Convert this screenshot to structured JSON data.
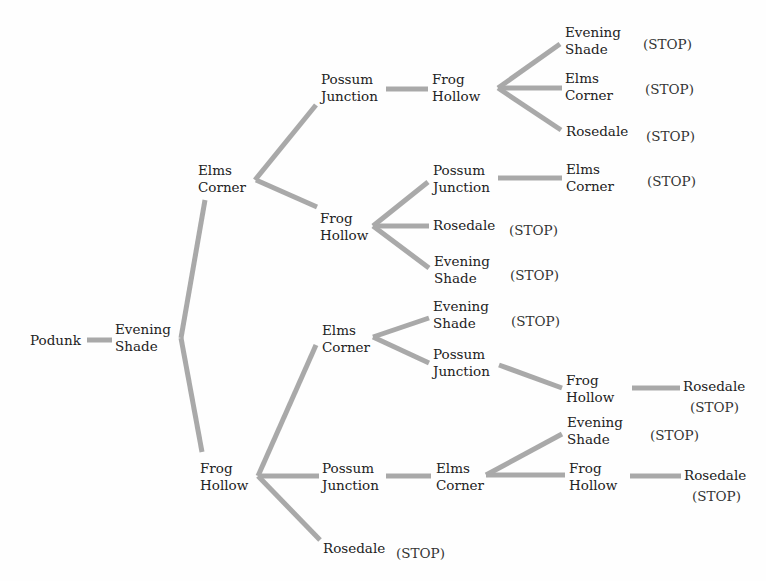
{
  "diagram": {
    "type": "tree",
    "root": "Podunk",
    "colors": {
      "edge": "#a9a9a9",
      "text": "#222222"
    },
    "nodes": [
      {
        "id": "n0",
        "lines": [
          "Podunk"
        ],
        "x": 30,
        "y": 332
      },
      {
        "id": "n1",
        "lines": [
          "Evening",
          "Shade"
        ],
        "x": 115,
        "y": 321
      },
      {
        "id": "n2",
        "lines": [
          "Elms",
          "Corner"
        ],
        "x": 198,
        "y": 162
      },
      {
        "id": "n3",
        "lines": [
          "Possum",
          "Junction"
        ],
        "x": 321,
        "y": 71
      },
      {
        "id": "n4",
        "lines": [
          "Frog",
          "Hollow"
        ],
        "x": 432,
        "y": 71
      },
      {
        "id": "n5",
        "lines": [
          "Evening",
          "Shade"
        ],
        "x": 565,
        "y": 24
      },
      {
        "id": "n6",
        "lines": [
          "Elms",
          "Corner"
        ],
        "x": 565,
        "y": 70
      },
      {
        "id": "n7",
        "lines": [
          "Rosedale"
        ],
        "x": 566,
        "y": 123
      },
      {
        "id": "n8",
        "lines": [
          "Frog",
          "Hollow"
        ],
        "x": 320,
        "y": 210
      },
      {
        "id": "n9",
        "lines": [
          "Possum",
          "Junction"
        ],
        "x": 433,
        "y": 162
      },
      {
        "id": "n10",
        "lines": [
          "Elms",
          "Corner"
        ],
        "x": 566,
        "y": 161
      },
      {
        "id": "n11",
        "lines": [
          "Rosedale"
        ],
        "x": 433,
        "y": 217
      },
      {
        "id": "n12",
        "lines": [
          "Evening",
          "Shade"
        ],
        "x": 434,
        "y": 253
      },
      {
        "id": "n13",
        "lines": [
          "Frog",
          "Hollow"
        ],
        "x": 200,
        "y": 460
      },
      {
        "id": "n14",
        "lines": [
          "Elms",
          "Corner"
        ],
        "x": 322,
        "y": 322
      },
      {
        "id": "n15",
        "lines": [
          "Evening",
          "Shade"
        ],
        "x": 433,
        "y": 298
      },
      {
        "id": "n16",
        "lines": [
          "Possum",
          "Junction"
        ],
        "x": 433,
        "y": 346
      },
      {
        "id": "n17",
        "lines": [
          "Frog",
          "Hollow"
        ],
        "x": 566,
        "y": 372
      },
      {
        "id": "n18",
        "lines": [
          "Rosedale"
        ],
        "x": 683,
        "y": 378
      },
      {
        "id": "n19",
        "lines": [
          "Possum",
          "Junction"
        ],
        "x": 322,
        "y": 460
      },
      {
        "id": "n20",
        "lines": [
          "Elms",
          "Corner"
        ],
        "x": 436,
        "y": 460
      },
      {
        "id": "n21",
        "lines": [
          "Evening",
          "Shade"
        ],
        "x": 567,
        "y": 414
      },
      {
        "id": "n22",
        "lines": [
          "Frog",
          "Hollow"
        ],
        "x": 569,
        "y": 460
      },
      {
        "id": "n23",
        "lines": [
          "Rosedale"
        ],
        "x": 684,
        "y": 467
      },
      {
        "id": "n24",
        "lines": [
          "Rosedale"
        ],
        "x": 323,
        "y": 540
      }
    ],
    "stop_label": "(STOP)",
    "stops": [
      {
        "after": "n5",
        "x": 643,
        "y": 36
      },
      {
        "after": "n6",
        "x": 645,
        "y": 81
      },
      {
        "after": "n7",
        "x": 646,
        "y": 128
      },
      {
        "after": "n10",
        "x": 647,
        "y": 173
      },
      {
        "after": "n11",
        "x": 509,
        "y": 222
      },
      {
        "after": "n12",
        "x": 510,
        "y": 267
      },
      {
        "after": "n15",
        "x": 511,
        "y": 313
      },
      {
        "after": "n18",
        "x": 690,
        "y": 399
      },
      {
        "after": "n21",
        "x": 650,
        "y": 427
      },
      {
        "after": "n23",
        "x": 692,
        "y": 488
      },
      {
        "after": "n24",
        "x": 396,
        "y": 545
      }
    ],
    "edges": [
      {
        "from": "n0",
        "to": "n1",
        "x1": 87,
        "y1": 340,
        "x2": 112,
        "y2": 340
      },
      {
        "from": "n1",
        "to": "n2",
        "x1": 181,
        "y1": 338,
        "x2": 205,
        "y2": 200
      },
      {
        "from": "n1",
        "to": "n13",
        "x1": 181,
        "y1": 338,
        "x2": 202,
        "y2": 452
      },
      {
        "from": "n2",
        "to": "n3",
        "x1": 255,
        "y1": 180,
        "x2": 316,
        "y2": 105
      },
      {
        "from": "n2",
        "to": "n8",
        "x1": 256,
        "y1": 180,
        "x2": 317,
        "y2": 207
      },
      {
        "from": "n3",
        "to": "n4",
        "x1": 386,
        "y1": 89,
        "x2": 428,
        "y2": 89
      },
      {
        "from": "n4",
        "to": "n5",
        "x1": 498,
        "y1": 88,
        "x2": 560,
        "y2": 44
      },
      {
        "from": "n4",
        "to": "n6",
        "x1": 498,
        "y1": 88,
        "x2": 562,
        "y2": 88
      },
      {
        "from": "n4",
        "to": "n7",
        "x1": 498,
        "y1": 88,
        "x2": 561,
        "y2": 130
      },
      {
        "from": "n8",
        "to": "n9",
        "x1": 373,
        "y1": 226,
        "x2": 428,
        "y2": 182
      },
      {
        "from": "n8",
        "to": "n11",
        "x1": 373,
        "y1": 226,
        "x2": 429,
        "y2": 226
      },
      {
        "from": "n8",
        "to": "n12",
        "x1": 373,
        "y1": 226,
        "x2": 429,
        "y2": 268
      },
      {
        "from": "n9",
        "to": "n10",
        "x1": 498,
        "y1": 178,
        "x2": 562,
        "y2": 178
      },
      {
        "from": "n13",
        "to": "n14",
        "x1": 258,
        "y1": 476,
        "x2": 316,
        "y2": 345
      },
      {
        "from": "n13",
        "to": "n19",
        "x1": 258,
        "y1": 476,
        "x2": 319,
        "y2": 476
      },
      {
        "from": "n13",
        "to": "n24",
        "x1": 258,
        "y1": 476,
        "x2": 320,
        "y2": 540
      },
      {
        "from": "n14",
        "to": "n15",
        "x1": 373,
        "y1": 337,
        "x2": 429,
        "y2": 318
      },
      {
        "from": "n14",
        "to": "n16",
        "x1": 373,
        "y1": 337,
        "x2": 429,
        "y2": 363
      },
      {
        "from": "n16",
        "to": "n17",
        "x1": 499,
        "y1": 365,
        "x2": 562,
        "y2": 388
      },
      {
        "from": "n17",
        "to": "n18",
        "x1": 632,
        "y1": 388,
        "x2": 680,
        "y2": 388
      },
      {
        "from": "n19",
        "to": "n20",
        "x1": 386,
        "y1": 476,
        "x2": 431,
        "y2": 476
      },
      {
        "from": "n20",
        "to": "n21",
        "x1": 486,
        "y1": 475,
        "x2": 562,
        "y2": 434
      },
      {
        "from": "n20",
        "to": "n22",
        "x1": 486,
        "y1": 475,
        "x2": 565,
        "y2": 475
      },
      {
        "from": "n22",
        "to": "n23",
        "x1": 630,
        "y1": 476,
        "x2": 681,
        "y2": 476
      }
    ]
  }
}
